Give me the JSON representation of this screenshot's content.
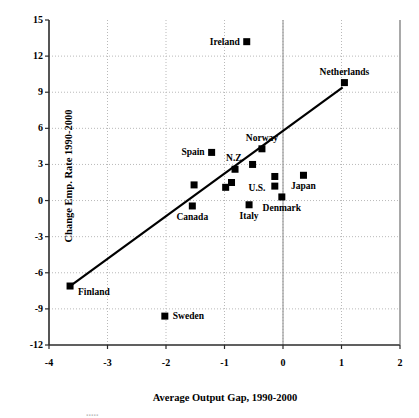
{
  "chart_data": {
    "type": "scatter",
    "title": "",
    "xlabel": "Average Output Gap, 1990-2000",
    "ylabel": "Change Emp. Rate 1990-2000",
    "xlim": [
      -4,
      2
    ],
    "ylim": [
      -12,
      15
    ],
    "xticks": [
      -4,
      -3,
      -2,
      -1,
      0,
      1,
      2
    ],
    "xtick_labels": [
      "-4",
      "-3",
      "-2",
      "-1",
      "0",
      "1",
      "2"
    ],
    "yticks": [
      -12,
      -9,
      -6,
      -3,
      0,
      3,
      6,
      9,
      12,
      15
    ],
    "ytick_labels": [
      "-12",
      "-9",
      "-6",
      "-3",
      "0",
      "3",
      "6",
      "9",
      "12",
      "15"
    ],
    "grid": true,
    "grid_style": "dotted",
    "marker": "filled-square",
    "marker_color": "#000000",
    "legend": "none",
    "points": [
      {
        "label": "Ireland",
        "x": -0.62,
        "y": 13.2,
        "label_pos": "left"
      },
      {
        "label": "Netherlands",
        "x": 1.05,
        "y": 9.8,
        "label_pos": "above"
      },
      {
        "label": "Norway",
        "x": -0.36,
        "y": 4.3,
        "label_pos": "above"
      },
      {
        "label": "Spain",
        "x": -1.22,
        "y": 4.0,
        "label_pos": "left"
      },
      {
        "label": "N.Z.",
        "x": -0.82,
        "y": 2.6,
        "label_pos": "above"
      },
      {
        "label": "U.S.",
        "x": -0.14,
        "y": 2.0,
        "label_pos": "none"
      },
      {
        "label": "",
        "x": -0.14,
        "y": 1.2,
        "label_pos": "none"
      },
      {
        "label": "",
        "x": -0.52,
        "y": 3.0,
        "label_pos": "none"
      },
      {
        "label": "",
        "x": -1.52,
        "y": 1.3,
        "label_pos": "none"
      },
      {
        "label": "",
        "x": -0.88,
        "y": 1.5,
        "label_pos": "none"
      },
      {
        "label": "",
        "x": -0.98,
        "y": 1.1,
        "label_pos": "none"
      },
      {
        "label": "Japan",
        "x": 0.35,
        "y": 2.1,
        "label_pos": "below"
      },
      {
        "label": "Denmark",
        "x": -0.02,
        "y": 0.3,
        "label_pos": "below"
      },
      {
        "label": "Italy",
        "x": -0.58,
        "y": -0.35,
        "label_pos": "below"
      },
      {
        "label": "Canada",
        "x": -1.55,
        "y": -0.45,
        "label_pos": "below"
      },
      {
        "label": "Finland",
        "x": -3.64,
        "y": -7.1,
        "label_pos": "left2"
      },
      {
        "label": "Sweden",
        "x": -2.02,
        "y": -9.6,
        "label_pos": "right"
      }
    ],
    "trend_line": {
      "x_start": -3.64,
      "y_start": -7.1,
      "x_end": 1.02,
      "y_end": 9.4
    },
    "annotations": {
      "us_label_x": -0.3,
      "us_label_y": 0.95
    }
  },
  "labels": {
    "ireland": "Ireland",
    "netherlands": "Netherlands",
    "norway": "Norway",
    "spain": "Spain",
    "nz": "N.Z.",
    "us": "U.S.",
    "japan": "Japan",
    "denmark": "Denmark",
    "italy": "Italy",
    "canada": "Canada",
    "finland": "Finland",
    "sweden": "Sweden"
  },
  "caption": {
    "cut_off_text": "....."
  }
}
